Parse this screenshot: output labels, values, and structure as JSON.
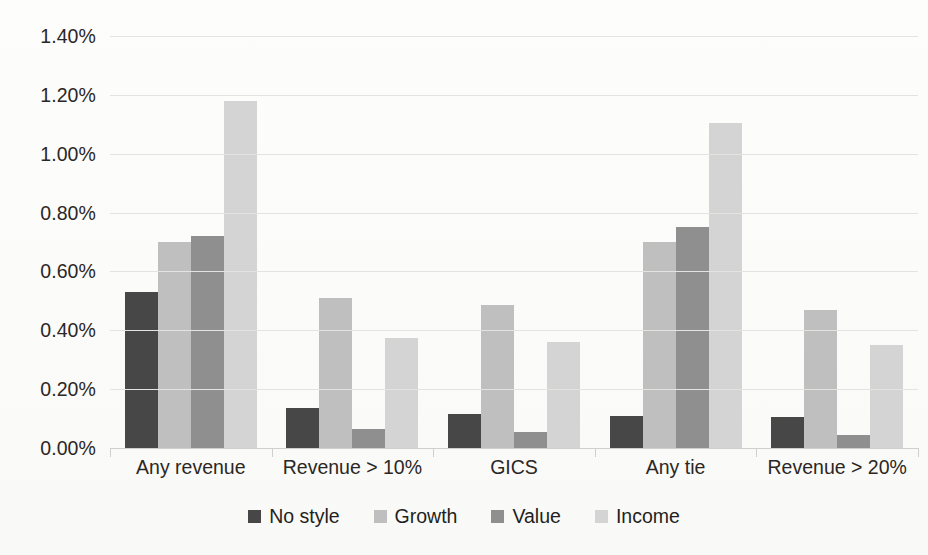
{
  "chart_data": {
    "type": "bar",
    "title": "",
    "xlabel": "",
    "ylabel": "",
    "categories": [
      "Any revenue",
      "Revenue > 10%",
      "GICS",
      "Any tie",
      "Revenue > 20%"
    ],
    "series": [
      {
        "name": "No style",
        "color": "#474747",
        "values": [
          0.53,
          0.135,
          0.115,
          0.11,
          0.105
        ]
      },
      {
        "name": "Growth",
        "color": "#bfbfbf",
        "values": [
          0.7,
          0.51,
          0.485,
          0.7,
          0.47
        ]
      },
      {
        "name": "Value",
        "color": "#8f8f8f",
        "values": [
          0.72,
          0.065,
          0.055,
          0.75,
          0.045
        ]
      },
      {
        "name": "Income",
        "color": "#d4d4d4",
        "values": [
          1.18,
          0.375,
          0.36,
          1.105,
          0.35
        ]
      }
    ],
    "ylim": [
      0,
      1.4
    ],
    "ytick_values": [
      0,
      0.2,
      0.4,
      0.6,
      0.8,
      1.0,
      1.2,
      1.4
    ],
    "ytick_labels": [
      "0.00%",
      "0.20%",
      "0.40%",
      "0.60%",
      "0.80%",
      "1.00%",
      "1.20%",
      "1.40%"
    ],
    "grid": true,
    "legend_position": "bottom",
    "gridline_color": "#e3e3e1",
    "background_color": "#fcfcfb"
  }
}
